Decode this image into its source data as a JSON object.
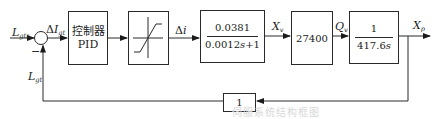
{
  "diagram": {
    "type": "closed-loop control block diagram",
    "signals": {
      "input": {
        "base": "L",
        "sub": "gtr"
      },
      "error": {
        "prefix": "Δ",
        "base": "I",
        "sub": "gt"
      },
      "feedback": {
        "base": "L",
        "sub": "gt"
      },
      "delta_i": {
        "prefix": "Δ",
        "base": "i"
      },
      "xv": {
        "base": "X",
        "sub": "v"
      },
      "qv": {
        "base": "Q",
        "sub": "v"
      },
      "xp": {
        "base": "X",
        "sub": "p"
      }
    },
    "summing_junction": {
      "minus_sign": "−"
    },
    "blocks": {
      "pid": {
        "line1": "控制器",
        "line2": "PID"
      },
      "saturation": {
        "kind": "saturation-nonlinearity"
      },
      "tf1": {
        "numerator": "0.0381",
        "denominator": "0.0012s+1"
      },
      "gain": {
        "value": "27400"
      },
      "tf2": {
        "numerator": "1",
        "denominator": "417.6s"
      },
      "feedback": {
        "value": "1"
      }
    },
    "caption_faint": "伺服系统结构框图"
  },
  "colors": {
    "line": "#2a2a2a",
    "background": "#ffffff"
  }
}
